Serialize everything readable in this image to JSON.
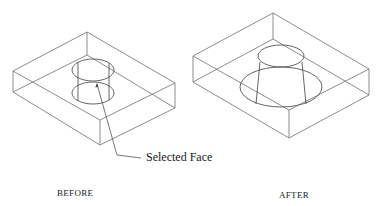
{
  "figure": {
    "callout": {
      "label": "Selected Face",
      "target": "cylindrical face of hole"
    },
    "panels": [
      {
        "id": "before",
        "caption": "BEFORE",
        "feature": "cylindrical hole"
      },
      {
        "id": "after",
        "caption": "AFTER",
        "feature": "tapered (drafted) conical hole"
      }
    ],
    "colors": {
      "background": "#ffffff",
      "lines": "#6e6e6e",
      "text": "#1a1a1a"
    }
  }
}
